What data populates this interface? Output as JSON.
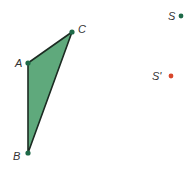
{
  "diagram": {
    "triangle": {
      "points": {
        "A": {
          "label": "A",
          "x": 28,
          "y": 63
        },
        "B": {
          "label": "B",
          "x": 28,
          "y": 153
        },
        "C": {
          "label": "C",
          "x": 72,
          "y": 32
        }
      },
      "fill_color": "#5fa97c",
      "stroke_color": "#1c2b22"
    },
    "points": {
      "S": {
        "label": "S",
        "x": 181,
        "y": 16,
        "color": "#1e6a48"
      },
      "S_prime": {
        "label": "S'",
        "x": 171,
        "y": 76,
        "color": "#d8472c"
      }
    },
    "vertex_color": "#1e6a48"
  }
}
